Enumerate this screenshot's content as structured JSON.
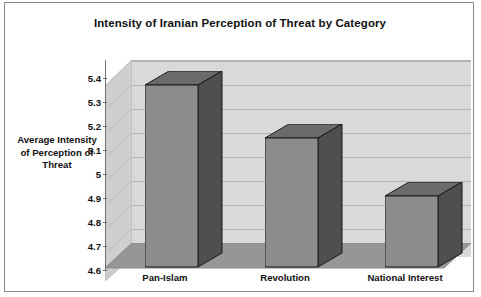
{
  "chart_data": {
    "type": "bar",
    "title": "Intensity of Iranian Perception of Threat by Category",
    "xlabel": "",
    "ylabel": "Average Intensity of Perception of Threat",
    "categories": [
      "Pan-Islam",
      "Revolution",
      "National Interest"
    ],
    "values": [
      5.39,
      5.17,
      4.93
    ],
    "ylim": [
      4.6,
      5.4
    ],
    "yticks": [
      "4.6",
      "4.7",
      "4.8",
      "4.9",
      "5",
      "5.1",
      "5.2",
      "5.3",
      "5.4"
    ],
    "grid": true,
    "legend": "none",
    "style": "3d-column",
    "colors": {
      "bar_front": "#8c8c8c",
      "bar_top": "#6b6b6b",
      "bar_side": "#4f4f4f",
      "wall": "#d9d9d9",
      "floor": "#969696",
      "gridline": "#b4b4b4",
      "text": "#111111",
      "border": "#8a8a8a"
    }
  },
  "axis": {
    "y_title_lines": [
      "Average Intensity",
      "of Perception of",
      "Threat"
    ]
  }
}
